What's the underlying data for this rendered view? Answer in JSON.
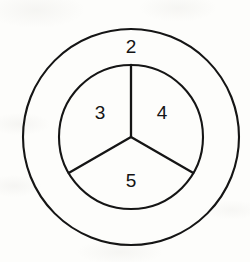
{
  "figure": {
    "name": "concentric-circles-trisected-inner-disc",
    "background_color": "#fdfdfb",
    "stroke_color": "#151515",
    "label_color": "#141414",
    "center": {
      "x": 131,
      "y": 137
    },
    "circles": [
      {
        "name": "outer-circle",
        "radius": 108,
        "stroke_width": 2.1
      },
      {
        "name": "inner-circle",
        "radius": 72,
        "stroke_width": 2.1
      }
    ],
    "spokes": [
      {
        "name": "spoke-up",
        "angle_deg": 90,
        "length": 72,
        "stroke_width": 2.3
      },
      {
        "name": "spoke-lower-left",
        "angle_deg": 210,
        "length": 72,
        "stroke_width": 2.3
      },
      {
        "name": "spoke-lower-right",
        "angle_deg": 330,
        "length": 72,
        "stroke_width": 2.3
      }
    ],
    "labels": [
      {
        "name": "region-label-2",
        "text": "2",
        "x": 131,
        "y": 47,
        "region": "annulus"
      },
      {
        "name": "region-label-3",
        "text": "3",
        "x": 100,
        "y": 113,
        "region": "inner-left-sector"
      },
      {
        "name": "region-label-4",
        "text": "4",
        "x": 162,
        "y": 113,
        "region": "inner-right-sector"
      },
      {
        "name": "region-label-5",
        "text": "5",
        "x": 131,
        "y": 181,
        "region": "inner-bottom-sector"
      }
    ]
  },
  "chart_data": {
    "type": "diagram",
    "title": "",
    "regions": [
      {
        "id": 2,
        "label": "2",
        "shape": "annulus between outer and inner circle"
      },
      {
        "id": 3,
        "label": "3",
        "shape": "inner sector spanning 90 to 210 degrees"
      },
      {
        "id": 4,
        "label": "4",
        "shape": "inner sector spanning 330 to 90 degrees"
      },
      {
        "id": 5,
        "label": "5",
        "shape": "inner sector spanning 210 to 330 degrees"
      }
    ],
    "labels": [
      "2",
      "3",
      "4",
      "5"
    ]
  }
}
